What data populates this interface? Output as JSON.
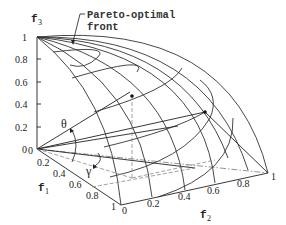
{
  "figure": {
    "type": "3d-pareto-front-diagram",
    "annotation": {
      "line1": "Pareto-optimal",
      "line2": "front"
    },
    "axes": {
      "f3": {
        "label": "f",
        "subscript": "3",
        "ticks": [
          "0",
          "0.2",
          "0.4",
          "0.6",
          "0.8",
          "1"
        ]
      },
      "f1": {
        "label": "f",
        "subscript": "1",
        "ticks": [
          "0",
          "0.2",
          "0.4",
          "0.6",
          "0.8",
          "1"
        ]
      },
      "f2": {
        "label": "f",
        "subscript": "2",
        "ticks": [
          "0",
          "0.2",
          "0.4",
          "0.6",
          "0.8",
          "1"
        ]
      }
    },
    "angles": {
      "theta": "θ",
      "gamma": "γ"
    },
    "colors": {
      "line": "#222222",
      "dashed": "#888888",
      "background": "#ffffff"
    }
  }
}
